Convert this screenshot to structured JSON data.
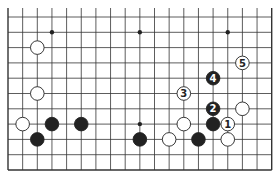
{
  "diagram": {
    "type": "go-board-partial",
    "grid": {
      "cols": 19,
      "rows": 11,
      "origin_x": 8,
      "origin_y": 17,
      "spacing_x": 14.65,
      "spacing_y": 15.3,
      "edges": {
        "left": true,
        "right": true,
        "bottom": true,
        "top": false
      }
    },
    "colors": {
      "line": "#333333",
      "black": "#222222",
      "white": "#ffffff",
      "background": "#ffffff"
    },
    "star_points": [
      {
        "col": 3,
        "row": 1
      },
      {
        "col": 9,
        "row": 1
      },
      {
        "col": 15,
        "row": 1
      },
      {
        "col": 9,
        "row": 7
      }
    ],
    "stones": [
      {
        "color": "white",
        "col": 2,
        "row": 2,
        "label": ""
      },
      {
        "color": "white",
        "col": 2,
        "row": 5,
        "label": ""
      },
      {
        "color": "white",
        "col": 1,
        "row": 7,
        "label": ""
      },
      {
        "color": "black",
        "col": 3,
        "row": 7,
        "label": ""
      },
      {
        "color": "black",
        "col": 5,
        "row": 7,
        "label": ""
      },
      {
        "color": "black",
        "col": 2,
        "row": 8,
        "label": ""
      },
      {
        "color": "black",
        "col": 9,
        "row": 8,
        "label": ""
      },
      {
        "color": "white",
        "col": 11,
        "row": 8,
        "label": ""
      },
      {
        "color": "white",
        "col": 12,
        "row": 7,
        "label": ""
      },
      {
        "color": "white",
        "col": 12,
        "row": 5,
        "label": "3"
      },
      {
        "color": "black",
        "col": 14,
        "row": 4,
        "label": "4"
      },
      {
        "color": "white",
        "col": 16,
        "row": 3,
        "label": "5"
      },
      {
        "color": "black",
        "col": 14,
        "row": 6,
        "label": "2"
      },
      {
        "color": "white",
        "col": 16,
        "row": 6,
        "label": ""
      },
      {
        "color": "black",
        "col": 14,
        "row": 7,
        "label": ""
      },
      {
        "color": "white",
        "col": 15,
        "row": 7,
        "label": "1"
      },
      {
        "color": "black",
        "col": 13,
        "row": 8,
        "label": ""
      },
      {
        "color": "white",
        "col": 15,
        "row": 8,
        "label": ""
      }
    ]
  }
}
